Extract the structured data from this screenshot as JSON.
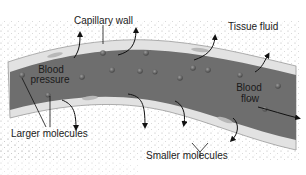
{
  "diagram": {
    "labels": {
      "capillary_wall": "Capillary wall",
      "tissue_fluid": "Tissue fluid",
      "blood_pressure_line1": "Blood",
      "blood_pressure_line2": "pressure",
      "blood_flow_line1": "Blood",
      "blood_flow_line2": "flow",
      "larger_molecules": "Larger molecules",
      "smaller_molecules": "Smaller molecules"
    },
    "colors": {
      "blood": "#6e6e6e",
      "wall": "#dcdcdc",
      "tissue_dots": "#9a9a9a",
      "molecule": "#555555",
      "arrow": "#111111"
    }
  }
}
